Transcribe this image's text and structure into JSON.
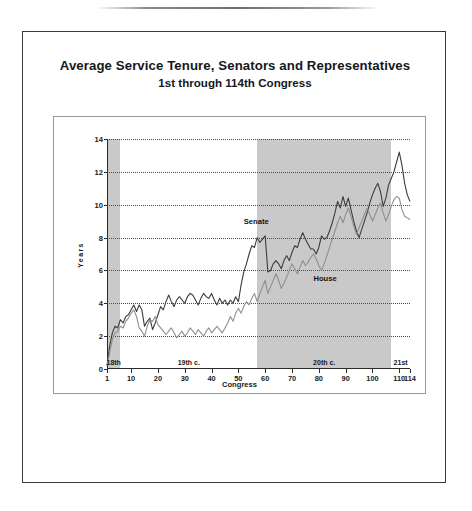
{
  "document": {
    "title_line1": "Average Service Tenure, Senators and Representatives",
    "title_line2": "1st through 114th Congress"
  },
  "chart_data": {
    "type": "line",
    "title": "Average Service Tenure, Senators and Representatives",
    "subtitle": "1st through 114th Congress",
    "xlabel": "Congress",
    "ylabel": "Years",
    "xlim": [
      1,
      114
    ],
    "ylim": [
      0,
      14
    ],
    "yticks": [
      0,
      2,
      4,
      6,
      8,
      10,
      12,
      14
    ],
    "xticks": [
      1,
      10,
      20,
      30,
      40,
      50,
      60,
      70,
      80,
      90,
      100,
      110,
      114
    ],
    "grid": "horizontal-dotted",
    "legend": "inline-labels",
    "annotations": [
      {
        "text": "Senate",
        "x": 52,
        "y": 8.9
      },
      {
        "text": "House",
        "x": 78,
        "y": 5.4
      }
    ],
    "shaded_bands": [
      {
        "label": "18th",
        "x_start": 1,
        "x_end": 6,
        "color": "#c9c9c9"
      },
      {
        "label": "19th c.",
        "x_start": 6,
        "x_end": 57,
        "color": "#ffffff"
      },
      {
        "label": "20th c.",
        "x_start": 57,
        "x_end": 107,
        "color": "#c9c9c9"
      },
      {
        "label": "21st",
        "x_start": 107,
        "x_end": 114,
        "color": "#ffffff"
      }
    ],
    "x": [
      1,
      2,
      3,
      4,
      5,
      6,
      7,
      8,
      9,
      10,
      11,
      12,
      13,
      14,
      15,
      16,
      17,
      18,
      19,
      20,
      21,
      22,
      23,
      24,
      25,
      26,
      27,
      28,
      29,
      30,
      31,
      32,
      33,
      34,
      35,
      36,
      37,
      38,
      39,
      40,
      41,
      42,
      43,
      44,
      45,
      46,
      47,
      48,
      49,
      50,
      51,
      52,
      53,
      54,
      55,
      56,
      57,
      58,
      59,
      60,
      61,
      62,
      63,
      64,
      65,
      66,
      67,
      68,
      69,
      70,
      71,
      72,
      73,
      74,
      75,
      76,
      77,
      78,
      79,
      80,
      81,
      82,
      83,
      84,
      85,
      86,
      87,
      88,
      89,
      90,
      91,
      92,
      93,
      94,
      95,
      96,
      97,
      98,
      99,
      100,
      101,
      102,
      103,
      104,
      105,
      106,
      107,
      108,
      109,
      110,
      111,
      112,
      113,
      114
    ],
    "series": [
      {
        "name": "Senate",
        "color": "#3c3c3c",
        "values": [
          0.2,
          1.4,
          2.2,
          2.6,
          2.5,
          3.0,
          2.8,
          3.2,
          3.3,
          3.6,
          3.9,
          3.5,
          3.9,
          3.6,
          2.6,
          2.9,
          3.1,
          2.4,
          2.8,
          3.3,
          3.8,
          3.6,
          4.1,
          4.5,
          4.1,
          3.8,
          4.2,
          4.4,
          4.2,
          4.0,
          4.4,
          4.6,
          4.5,
          4.2,
          3.9,
          4.3,
          4.6,
          4.4,
          4.3,
          4.6,
          4.2,
          3.9,
          4.3,
          4.0,
          4.2,
          3.9,
          4.2,
          4.0,
          4.4,
          4.1,
          5.1,
          5.9,
          6.4,
          7.0,
          7.5,
          7.4,
          8.0,
          7.7,
          7.9,
          8.1,
          5.9,
          6.0,
          6.4,
          6.6,
          6.4,
          6.1,
          6.6,
          6.9,
          6.6,
          7.1,
          7.5,
          7.4,
          7.9,
          8.3,
          7.9,
          7.6,
          7.3,
          7.3,
          7.0,
          7.4,
          8.1,
          7.9,
          8.0,
          8.4,
          8.9,
          9.5,
          10.2,
          9.8,
          10.5,
          9.9,
          10.4,
          9.7,
          9.0,
          8.4,
          8.0,
          8.5,
          9.0,
          9.5,
          10.1,
          10.6,
          11.0,
          11.3,
          10.8,
          9.9,
          10.4,
          11.2,
          11.6,
          12.0,
          12.6,
          13.2,
          12.4,
          11.3,
          10.6,
          10.2
        ]
      },
      {
        "name": "House",
        "color": "#8f8f8f",
        "values": [
          0.2,
          1.0,
          1.8,
          2.2,
          2.3,
          2.6,
          2.5,
          2.9,
          3.1,
          3.4,
          3.6,
          3.2,
          2.5,
          2.3,
          2.0,
          2.6,
          3.0,
          2.9,
          3.2,
          2.7,
          2.5,
          2.3,
          2.1,
          2.3,
          2.5,
          2.2,
          1.9,
          2.1,
          2.3,
          2.0,
          2.2,
          2.5,
          2.3,
          2.1,
          2.4,
          2.2,
          2.0,
          2.3,
          2.5,
          2.2,
          2.4,
          2.6,
          2.4,
          2.2,
          2.5,
          2.8,
          3.2,
          2.9,
          3.4,
          3.7,
          3.4,
          3.8,
          4.1,
          3.9,
          4.3,
          4.6,
          4.1,
          4.6,
          5.0,
          5.4,
          4.6,
          5.0,
          5.4,
          5.8,
          5.4,
          4.9,
          5.2,
          5.6,
          6.0,
          6.4,
          6.1,
          5.8,
          6.2,
          6.6,
          6.3,
          6.5,
          6.8,
          7.0,
          6.7,
          6.3,
          6.0,
          6.4,
          6.9,
          7.4,
          7.9,
          8.4,
          8.9,
          9.3,
          8.9,
          9.4,
          9.8,
          9.3,
          8.7,
          8.2,
          8.6,
          9.0,
          9.4,
          9.8,
          9.4,
          9.0,
          9.4,
          9.8,
          10.1,
          9.5,
          9.0,
          9.4,
          9.9,
          10.3,
          10.5,
          10.4,
          9.7,
          9.3,
          9.2,
          9.1
        ]
      }
    ]
  }
}
